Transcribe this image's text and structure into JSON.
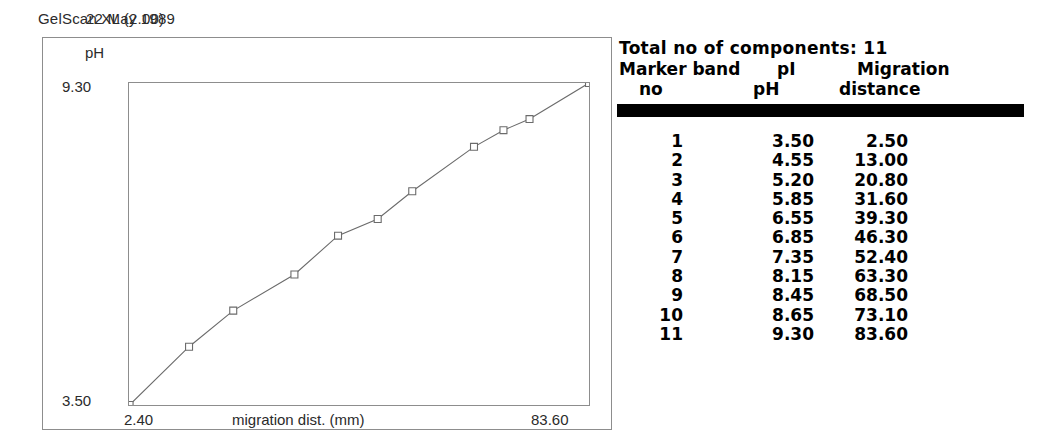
{
  "header": {
    "app_title": "GelScan XL (2.00)",
    "date": "22 May 1989"
  },
  "chart": {
    "y_axis_title": "pH",
    "y_max_label": "9.30",
    "y_min_label": "3.50",
    "x_axis_title": "migration dist. (mm)",
    "x_min_label": "2.40",
    "x_max_label": "83.60",
    "line_color": "#6b6b6b",
    "marker_color": "#6b6b6b",
    "frame_color": "#8d8d8d"
  },
  "table": {
    "total_label": "Total no of components: 11",
    "header_line1": {
      "col1": "Marker band",
      "col2": "pI",
      "col3": "Migration"
    },
    "header_line2": {
      "col1": "no",
      "col2": "pH",
      "col3": "distance"
    },
    "rows": [
      {
        "no": "1",
        "ph": "3.50",
        "distance": "2.50"
      },
      {
        "no": "2",
        "ph": "4.55",
        "distance": "13.00"
      },
      {
        "no": "3",
        "ph": "5.20",
        "distance": "20.80"
      },
      {
        "no": "4",
        "ph": "5.85",
        "distance": "31.60"
      },
      {
        "no": "5",
        "ph": "6.55",
        "distance": "39.30"
      },
      {
        "no": "6",
        "ph": "6.85",
        "distance": "46.30"
      },
      {
        "no": "7",
        "ph": "7.35",
        "distance": "52.40"
      },
      {
        "no": "8",
        "ph": "8.15",
        "distance": "63.30"
      },
      {
        "no": "9",
        "ph": "8.45",
        "distance": "68.50"
      },
      {
        "no": "10",
        "ph": "8.65",
        "distance": "73.10"
      },
      {
        "no": "11",
        "ph": "9.30",
        "distance": "83.60"
      }
    ]
  },
  "chart_data": {
    "type": "line",
    "title": "",
    "xlabel": "migration dist. (mm)",
    "ylabel": "pH",
    "xlim": [
      2.4,
      83.6
    ],
    "ylim": [
      3.5,
      9.3
    ],
    "grid": false,
    "legend": false,
    "marker": "open-square",
    "x": [
      2.5,
      13.0,
      20.8,
      31.6,
      39.3,
      46.3,
      52.4,
      63.3,
      68.5,
      73.1,
      83.6
    ],
    "y": [
      3.5,
      4.55,
      5.2,
      5.85,
      6.55,
      6.85,
      7.35,
      8.15,
      8.45,
      8.65,
      9.3
    ],
    "series": [
      {
        "name": "pH calibration curve",
        "x": [
          2.5,
          13.0,
          20.8,
          31.6,
          39.3,
          46.3,
          52.4,
          63.3,
          68.5,
          73.1,
          83.6
        ],
        "values": [
          3.5,
          4.55,
          5.2,
          5.85,
          6.55,
          6.85,
          7.35,
          8.15,
          8.45,
          8.65,
          9.3
        ]
      }
    ]
  }
}
